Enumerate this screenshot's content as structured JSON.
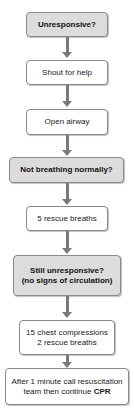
{
  "flowchart": {
    "steps": [
      {
        "label": "Unresponsive?",
        "type": "decision"
      },
      {
        "label": "Shout for help",
        "type": "action"
      },
      {
        "label": "Open airway",
        "type": "action"
      },
      {
        "label": "Not breathing normally?",
        "type": "decision"
      },
      {
        "label": "5 rescue breaths",
        "type": "action"
      },
      {
        "line1": "Still unresponsive?",
        "line2": "(no signs of circulation)",
        "type": "decision"
      },
      {
        "line1": "15 chest compressions",
        "line2": "2 rescue breaths",
        "type": "action"
      },
      {
        "line1": "After 1 minute call resuscitation",
        "line2_prefix": "team then continue ",
        "line2_bold": "CPR",
        "type": "action"
      }
    ],
    "colors": {
      "decision_fill": "#dcdcdc",
      "action_fill": "#ffffff",
      "arrow": "#7a7a7a",
      "border": "#8a8a8a"
    }
  }
}
